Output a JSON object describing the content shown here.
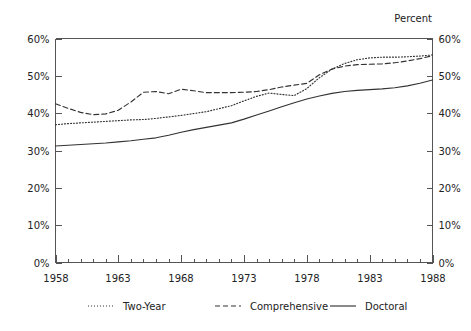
{
  "chart_data": {
    "type": "line",
    "title": "",
    "subtitle": "",
    "xlabel": "",
    "ylabel": "Percent",
    "ylabel_position": "top-right",
    "grid": false,
    "legend_position": "bottom",
    "xlim": [
      1958,
      1988
    ],
    "ylim": [
      0,
      60
    ],
    "x_tick_labels": [
      "1958",
      "1963",
      "1968",
      "1973",
      "1978",
      "1983",
      "1988"
    ],
    "x_tick_values": [
      1958,
      1963,
      1968,
      1973,
      1978,
      1983,
      1988
    ],
    "x_minor_tick_interval": 1,
    "y_tick_labels": [
      "0%",
      "10%",
      "20%",
      "30%",
      "40%",
      "50%",
      "60%"
    ],
    "y_tick_values": [
      0,
      10,
      20,
      30,
      40,
      50,
      60
    ],
    "y_axis_right_tick_labels": [
      "0%",
      "10%",
      "20%",
      "30%",
      "40%",
      "50%",
      "60%"
    ],
    "y_unit": "%",
    "x": [
      1958,
      1959,
      1960,
      1961,
      1962,
      1963,
      1964,
      1965,
      1966,
      1967,
      1968,
      1969,
      1970,
      1971,
      1972,
      1973,
      1974,
      1975,
      1976,
      1977,
      1978,
      1979,
      1980,
      1981,
      1982,
      1983,
      1984,
      1985,
      1986,
      1987,
      1988
    ],
    "series": [
      {
        "name": "Two-Year",
        "style": "dotted",
        "color": "#333333",
        "values": [
          36.9,
          37.2,
          37.4,
          37.6,
          37.8,
          38.0,
          38.2,
          38.3,
          38.6,
          39.0,
          39.4,
          39.9,
          40.4,
          41.2,
          42.0,
          43.3,
          44.5,
          45.4,
          45.0,
          44.7,
          46.6,
          49.5,
          51.8,
          53.3,
          54.3,
          54.8,
          55.0,
          55.0,
          55.1,
          55.3,
          55.6
        ]
      },
      {
        "name": "Comprehensive",
        "style": "dashed",
        "color": "#333333",
        "values": [
          42.5,
          41.3,
          40.2,
          39.6,
          39.8,
          40.8,
          43.0,
          45.6,
          45.8,
          45.2,
          46.4,
          46.0,
          45.5,
          45.5,
          45.5,
          45.6,
          45.8,
          46.3,
          47.0,
          47.5,
          48.0,
          50.3,
          51.8,
          52.6,
          53.0,
          53.1,
          53.2,
          53.5,
          54.0,
          54.6,
          55.4
        ]
      },
      {
        "name": "Doctoral",
        "style": "solid",
        "color": "#333333",
        "values": [
          31.2,
          31.4,
          31.6,
          31.8,
          32.0,
          32.3,
          32.6,
          33.0,
          33.4,
          34.1,
          34.9,
          35.6,
          36.2,
          36.8,
          37.4,
          38.4,
          39.5,
          40.6,
          41.7,
          42.8,
          43.8,
          44.6,
          45.3,
          45.8,
          46.1,
          46.3,
          46.5,
          46.8,
          47.3,
          48.0,
          48.9
        ]
      }
    ]
  },
  "legend": {
    "items": [
      {
        "label": "Two-Year",
        "style": "dotted"
      },
      {
        "label": "Comprehensive",
        "style": "dashed"
      },
      {
        "label": "Doctoral",
        "style": "solid"
      }
    ]
  },
  "axis_titles": {
    "top_right": "Percent"
  }
}
